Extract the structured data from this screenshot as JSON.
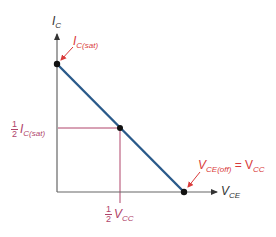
{
  "diagram": {
    "type": "dc-load-line",
    "colors": {
      "axis": "#555555",
      "load_line": "#2a5a8a",
      "guide": "#b0446a",
      "annotation": "#d93a3a",
      "axis_label": "#333333",
      "point": "#111111"
    },
    "axes": {
      "y_label_main": "I",
      "y_label_sub": "C",
      "x_label_main": "V",
      "x_label_sub": "CE"
    },
    "points": [
      {
        "name": "saturation",
        "label_main": "I",
        "label_sub": "C(sat)"
      },
      {
        "name": "midpoint"
      },
      {
        "name": "cutoff",
        "label_main": "V",
        "label_sub": "CE(off)",
        "equals": "= V",
        "equals_sub": "CC"
      }
    ],
    "guides": {
      "y_frac_num": "1",
      "y_frac_den": "2",
      "y_label_main": "I",
      "y_label_sub": "C(sat)",
      "x_frac_num": "1",
      "x_frac_den": "2",
      "x_label_main": "V",
      "x_label_sub": "CC"
    }
  }
}
